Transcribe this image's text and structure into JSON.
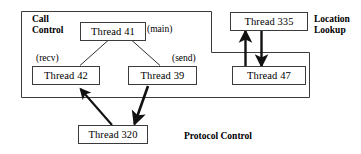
{
  "diagram": {
    "background_color": "#ffffff",
    "line_color": "#3b3b3b",
    "arrow_color": "#111111",
    "groups": [
      {
        "id": "call-control",
        "label": "Call\nControl"
      },
      {
        "id": "location-lookup",
        "label": "Location\nLookup"
      },
      {
        "id": "protocol-control",
        "label": "Protocol Control"
      }
    ],
    "nodes": [
      {
        "id": "thread-41",
        "label": "Thread 41"
      },
      {
        "id": "thread-42",
        "label": "Thread 42"
      },
      {
        "id": "thread-39",
        "label": "Thread 39"
      },
      {
        "id": "thread-320",
        "label": "Thread 320"
      },
      {
        "id": "thread-335",
        "label": "Thread 335"
      },
      {
        "id": "thread-47",
        "label": "Thread 47"
      }
    ],
    "annotations": [
      {
        "id": "main-label",
        "label": "(main)"
      },
      {
        "id": "recv-label",
        "label": "(recv)"
      },
      {
        "id": "send-label",
        "label": "(send)"
      }
    ],
    "edges": [
      {
        "id": "e-41-42",
        "from": "thread-41",
        "to": "thread-42",
        "style": "thin",
        "arrow": "none"
      },
      {
        "id": "e-41-39",
        "from": "thread-41",
        "to": "thread-39",
        "style": "thin",
        "arrow": "none"
      },
      {
        "id": "e-320-42",
        "from": "thread-320",
        "to": "thread-42",
        "style": "thick",
        "arrow": "end"
      },
      {
        "id": "e-39-320",
        "from": "thread-39",
        "to": "thread-320",
        "style": "thick",
        "arrow": "end"
      },
      {
        "id": "e-47-335",
        "from": "thread-47",
        "to": "thread-335",
        "style": "thick",
        "arrow": "end"
      },
      {
        "id": "e-335-47",
        "from": "thread-335",
        "to": "thread-47",
        "style": "thick",
        "arrow": "end"
      }
    ]
  }
}
